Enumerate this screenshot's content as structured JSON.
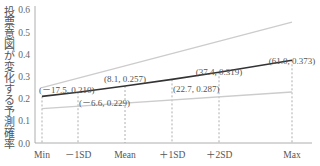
{
  "chart_data": {
    "type": "line",
    "title": "",
    "xlabel": "",
    "ylabel": "投票意図が変化する予測確率",
    "ylim": [
      0.0,
      0.6
    ],
    "yticks": [
      "0.0",
      "0.1",
      "0.2",
      "0.3",
      "0.4",
      "0.5",
      "0.6"
    ],
    "categories": [
      "Min",
      "－1SD",
      "Mean",
      "＋1SD",
      "＋2SD",
      "Max"
    ],
    "series": [
      {
        "name": "predicted probability",
        "x": [
          -17.5,
          -6.6,
          8.1,
          22.7,
          37.4,
          61.0
        ],
        "values": [
          0.21,
          0.229,
          0.257,
          0.287,
          0.319,
          0.373
        ]
      },
      {
        "name": "upper confidence bound",
        "x": [
          -17.5,
          61.0
        ],
        "values": [
          0.25,
          0.545
        ]
      },
      {
        "name": "lower confidence bound",
        "x": [
          -17.5,
          61.0
        ],
        "values": [
          0.155,
          0.23
        ]
      }
    ],
    "annotations": [
      "(－17.5, 0.210)",
      "(－6.6, 0.229)",
      "(8.1, 0.257)",
      "(22.7, 0.287)",
      "(37.4, 0.319)",
      "(61.0, 0.373)"
    ],
    "grid": false,
    "legend": "none",
    "colors": {
      "main_line": "#333333",
      "ci_line": "#cccccc",
      "axis": "#999999",
      "guide": "#999999"
    }
  }
}
